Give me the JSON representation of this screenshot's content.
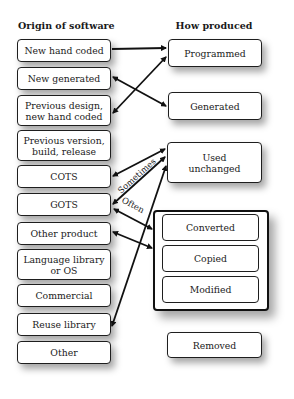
{
  "headers": {
    "left": "Origin of software",
    "right": "How produced"
  },
  "origins": [
    {
      "id": "new-hand-coded",
      "label": "New hand coded"
    },
    {
      "id": "new-generated",
      "label": "New generated"
    },
    {
      "id": "previous-design",
      "label": "Previous design, new hand coded"
    },
    {
      "id": "previous-version",
      "label": "Previous version, build, release"
    },
    {
      "id": "cots",
      "label": "COTS"
    },
    {
      "id": "gots",
      "label": "GOTS"
    },
    {
      "id": "other-product",
      "label": "Other product"
    },
    {
      "id": "language-library",
      "label": "Language library or OS"
    },
    {
      "id": "commercial",
      "label": "Commercial"
    },
    {
      "id": "reuse-library",
      "label": "Reuse library"
    },
    {
      "id": "other",
      "label": "Other"
    }
  ],
  "productions": [
    {
      "id": "programmed",
      "label": "Programmed"
    },
    {
      "id": "generated",
      "label": "Generated"
    },
    {
      "id": "used-unchanged",
      "label": "Used unchanged"
    },
    {
      "id": "converted",
      "label": "Converted"
    },
    {
      "id": "copied",
      "label": "Copied"
    },
    {
      "id": "modified",
      "label": "Modified"
    },
    {
      "id": "removed",
      "label": "Removed"
    }
  ],
  "edge_labels": {
    "sometimes": "Sometimes",
    "often": "Often"
  },
  "edges": [
    {
      "from": "New hand coded",
      "to": "Programmed",
      "style": "arrow-to-target"
    },
    {
      "from": "Previous design, new hand coded",
      "to": "Programmed",
      "style": "double-arrow"
    },
    {
      "from": "New generated",
      "to": "Generated",
      "style": "double-arrow"
    },
    {
      "from": "COTS",
      "to": "Used unchanged",
      "style": "double-arrow",
      "label": "Sometimes"
    },
    {
      "from": "GOTS",
      "to": "Used unchanged",
      "style": "double-arrow"
    },
    {
      "from": "GOTS",
      "to": "Converted/Copied/Modified",
      "style": "double-arrow",
      "label": "Often"
    },
    {
      "from": "Other product",
      "to": "Converted/Copied/Modified",
      "style": "double-arrow"
    },
    {
      "from": "Reuse library",
      "to": "Used unchanged",
      "style": "double-arrow"
    }
  ]
}
